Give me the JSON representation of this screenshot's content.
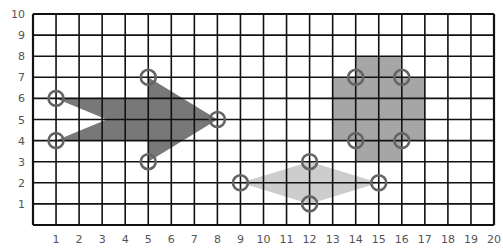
{
  "diagram": {
    "type": "coordinate-grid",
    "x_axis": {
      "min": 0,
      "max": 20,
      "ticks": [
        "1",
        "2",
        "3",
        "4",
        "5",
        "6",
        "7",
        "8",
        "9",
        "10",
        "11",
        "12",
        "13",
        "14",
        "15",
        "16",
        "17",
        "18",
        "19",
        "20"
      ]
    },
    "y_axis": {
      "min": 0,
      "max": 10,
      "ticks": [
        "1",
        "2",
        "3",
        "4",
        "5",
        "6",
        "7",
        "8",
        "9",
        "10"
      ]
    },
    "colors": {
      "grid": "#111111",
      "arrow_fill": "#787878",
      "cross_fill": "#a6a6a6",
      "diamond_fill": "#cdcdcd",
      "marker_stroke": "#646464",
      "label": "#555555"
    },
    "shapes": [
      {
        "name": "arrow",
        "fill_key": "arrow_fill",
        "polygon": [
          [
            1,
            6
          ],
          [
            5,
            6
          ],
          [
            5,
            7
          ],
          [
            8,
            5
          ],
          [
            5,
            3
          ],
          [
            5,
            4
          ],
          [
            1,
            4
          ],
          [
            3.2,
            5
          ]
        ],
        "markers": [
          [
            1,
            6
          ],
          [
            1,
            4
          ],
          [
            5,
            7
          ],
          [
            5,
            3
          ],
          [
            8,
            5
          ]
        ]
      },
      {
        "name": "cross",
        "fill_key": "cross_fill",
        "polygon": [
          [
            14,
            8
          ],
          [
            16,
            8
          ],
          [
            16,
            7
          ],
          [
            17,
            7
          ],
          [
            17,
            4
          ],
          [
            16,
            4
          ],
          [
            16,
            3
          ],
          [
            14,
            3
          ],
          [
            14,
            4
          ],
          [
            13,
            4
          ],
          [
            13,
            7
          ],
          [
            14,
            7
          ]
        ],
        "markers": [
          [
            14,
            7
          ],
          [
            16,
            7
          ],
          [
            14,
            4
          ],
          [
            16,
            4
          ]
        ]
      },
      {
        "name": "diamond",
        "fill_key": "diamond_fill",
        "polygon": [
          [
            9,
            2
          ],
          [
            12,
            3
          ],
          [
            15,
            2
          ],
          [
            12,
            1
          ]
        ],
        "markers": [
          [
            9,
            2
          ],
          [
            12,
            3
          ],
          [
            15,
            2
          ],
          [
            12,
            1
          ]
        ]
      }
    ]
  }
}
